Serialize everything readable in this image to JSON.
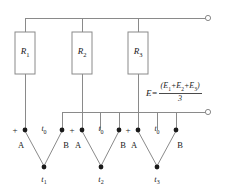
{
  "diagram": {
    "colors": {
      "wire": "#8a8a8a",
      "node": "#1a1a1a",
      "text": "#1a1a1a",
      "background": "#ffffff"
    },
    "resistors": [
      {
        "label": "R",
        "sub": "1"
      },
      {
        "label": "R",
        "sub": "2"
      },
      {
        "label": "R",
        "sub": "3"
      }
    ],
    "thermocouples": [
      {
        "plus": "+",
        "reference": "t",
        "reference_sub": "0",
        "leg_a": "A",
        "leg_b": "B",
        "junction": "t",
        "junction_sub": "1"
      },
      {
        "plus": "+",
        "reference": "t",
        "reference_sub": "0",
        "leg_a": "A",
        "leg_b": "B",
        "junction": "t",
        "junction_sub": "2"
      },
      {
        "plus": "+",
        "reference": "t",
        "reference_sub": "0",
        "leg_a": "A",
        "leg_b": "B",
        "junction": "t",
        "junction_sub": "3"
      }
    ],
    "formula": {
      "lhs": "E=",
      "numerator_open": "(",
      "numerator_e1": "E",
      "numerator_e1_sub": "1",
      "numerator_plus1": "+",
      "numerator_e2": "E",
      "numerator_e2_sub": "2",
      "numerator_plus2": "+",
      "numerator_e3": "E",
      "numerator_e3_sub": "3",
      "numerator_close": ")",
      "denominator": "3",
      "full_text": "E=(E1+E2+E3)/3"
    },
    "terminals": [
      {
        "name": "top-output-terminal"
      },
      {
        "name": "bottom-output-terminal"
      }
    ]
  }
}
